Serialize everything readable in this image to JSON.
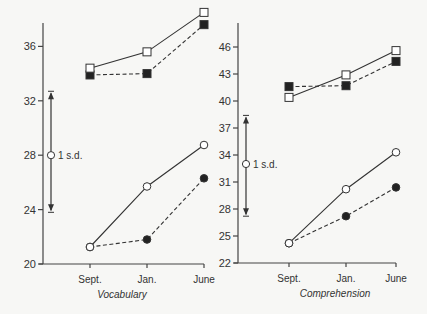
{
  "chart_data": [
    {
      "type": "line",
      "title": "Vocabulary",
      "xlabel": "Vocabulary",
      "ylabel": "",
      "categories": [
        "Sept.",
        "Jan.",
        "June"
      ],
      "yticks": [
        20,
        24,
        28,
        32,
        36
      ],
      "ylim": [
        20,
        39
      ],
      "grid": false,
      "legend": "none",
      "series": [
        {
          "name": "Upper group (open squares, solid)",
          "marker": "open-square",
          "line": "solid",
          "values": [
            34.4,
            35.6,
            38.5
          ]
        },
        {
          "name": "Upper group (filled squares, dashed)",
          "marker": "filled-square",
          "line": "dashed",
          "values": [
            33.9,
            34.0,
            37.6
          ]
        },
        {
          "name": "Lower group (open circles, solid)",
          "marker": "open-circle",
          "line": "solid",
          "values": [
            21.25,
            25.7,
            28.75
          ]
        },
        {
          "name": "Lower group (filled circles, dashed)",
          "marker": "filled-circle",
          "line": "dashed",
          "values": [
            21.25,
            21.8,
            26.3
          ]
        }
      ],
      "annotations": [
        {
          "text": "1 s.d.",
          "type": "sd-bar",
          "center": 28.0,
          "low": 23.8,
          "high": 32.7
        }
      ]
    },
    {
      "type": "line",
      "title": "Comprehension",
      "xlabel": "Comprehension",
      "ylabel": "",
      "categories": [
        "Sept.",
        "Jan.",
        "June"
      ],
      "yticks": [
        22,
        25,
        28,
        31,
        34,
        37,
        40,
        43,
        46
      ],
      "ylim": [
        22,
        48
      ],
      "grid": false,
      "legend": "none",
      "series": [
        {
          "name": "Upper group (open squares, solid)",
          "marker": "open-square",
          "line": "solid",
          "values": [
            40.4,
            42.9,
            45.6
          ]
        },
        {
          "name": "Upper group (filled squares, dashed)",
          "marker": "filled-square",
          "line": "dashed",
          "values": [
            41.6,
            41.7,
            44.4
          ]
        },
        {
          "name": "Lower group (open circles, solid)",
          "marker": "open-circle",
          "line": "solid",
          "values": [
            24.2,
            30.2,
            34.3
          ]
        },
        {
          "name": "Lower group (filled circles, dashed)",
          "marker": "filled-circle",
          "line": "dashed",
          "values": [
            24.2,
            27.2,
            30.4
          ]
        }
      ],
      "annotations": [
        {
          "text": "1 s.d.",
          "type": "sd-bar",
          "center": 33.0,
          "low": 27.2,
          "high": 38.4
        }
      ]
    }
  ],
  "layout": {
    "panels": [
      {
        "axis_x": 43,
        "axis_top": 23,
        "axis_bottom": 264,
        "x_end": 204,
        "cat_x": [
          90,
          147,
          204
        ],
        "y_min": 20,
        "px_per_unit": 13.6,
        "sd_x": 51,
        "title_x": 122
      },
      {
        "axis_x": 238,
        "axis_top": 23,
        "axis_bottom": 263,
        "x_end": 396,
        "cat_x": [
          289,
          346,
          396
        ],
        "y_min": 22,
        "px_per_unit": 9.0,
        "sd_x": 246,
        "title_x": 335
      }
    ]
  },
  "colors": {
    "ink": "#333333",
    "background": "#f7f7f5",
    "open_fill": "#ffffff"
  }
}
